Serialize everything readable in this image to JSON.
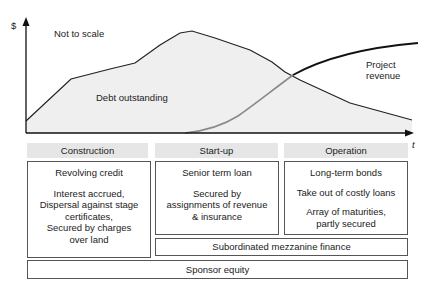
{
  "axes": {
    "y_label": "$",
    "x_label": "t"
  },
  "annotations": {
    "not_to_scale": "Not to scale",
    "debt_outstanding": "Debt outstanding",
    "project_revenue_line1": "Project",
    "project_revenue_line2": "revenue"
  },
  "phases": [
    {
      "header": "Construction",
      "items": [
        "Revolving credit",
        "Interest accrued,",
        "Dispersal against stage",
        "certificates,",
        "Secured by charges",
        "over land"
      ]
    },
    {
      "header": "Start-up",
      "items": [
        "Senior term loan",
        "Secured by",
        "assignments of revenue",
        "& insurance"
      ]
    },
    {
      "header": "Operation",
      "items": [
        "Long-term bonds",
        "Take out of costly loans",
        "Array of maturities,",
        "partly secured"
      ]
    }
  ],
  "mezzanine": "Subordinated mezzanine finance",
  "sponsor_equity": "Sponsor equity",
  "colors": {
    "debt_fill": "#efefef",
    "revenue_early": "#8a8a8a",
    "revenue_late": "#111111",
    "header_bg": "#e6e6e6"
  }
}
